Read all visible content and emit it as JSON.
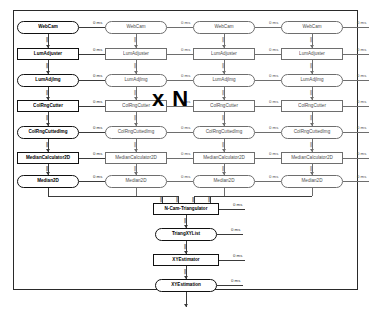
{
  "diagram": {
    "multiplier_label": "x N",
    "timing_label": "0 ms",
    "colors": {
      "primary_stroke": "#111111",
      "secondary_stroke": "#6e6e6e",
      "frame": "#2a2a2a",
      "text": "#2b2b2b",
      "background": "#ffffff"
    },
    "camera_branches": [
      {
        "index": 1,
        "emphasis": "primary",
        "nodes": [
          {
            "label": "WebCam",
            "shape": "data",
            "timing": "0 ms"
          },
          {
            "label": "LumAdjuster",
            "shape": "proc",
            "timing": "0 ms"
          },
          {
            "label": "LumAdjImg",
            "shape": "data",
            "timing": "0 ms"
          },
          {
            "label": "ColRngCutter",
            "shape": "proc",
            "timing": "0 ms"
          },
          {
            "label": "ColRngCuttedImg",
            "shape": "data",
            "timing": "0 ms"
          },
          {
            "label": "MedianCalculator2D",
            "shape": "proc",
            "timing": "0 ms"
          },
          {
            "label": "Median2D",
            "shape": "data",
            "timing": "0 ms"
          }
        ]
      },
      {
        "index": 2,
        "emphasis": "dim",
        "nodes": [
          {
            "label": "WebCam",
            "shape": "data",
            "timing": "0 ms"
          },
          {
            "label": "LumAdjuster",
            "shape": "proc",
            "timing": "0 ms"
          },
          {
            "label": "LumAdjImg",
            "shape": "data",
            "timing": "0 ms"
          },
          {
            "label": "ColRngCutter",
            "shape": "proc",
            "timing": "0 ms"
          },
          {
            "label": "ColRngCuttedImg",
            "shape": "data",
            "timing": "0 ms"
          },
          {
            "label": "MedianCalculator2D",
            "shape": "proc",
            "timing": "0 ms"
          },
          {
            "label": "Median2D",
            "shape": "data",
            "timing": "0 ms"
          }
        ]
      },
      {
        "index": 3,
        "emphasis": "dim",
        "nodes": [
          {
            "label": "WebCam",
            "shape": "data",
            "timing": "0 ms"
          },
          {
            "label": "LumAdjuster",
            "shape": "proc",
            "timing": "0 ms"
          },
          {
            "label": "LumAdjImg",
            "shape": "data",
            "timing": "0 ms"
          },
          {
            "label": "ColRngCutter",
            "shape": "proc",
            "timing": "0 ms"
          },
          {
            "label": "ColRngCuttedImg",
            "shape": "data",
            "timing": "0 ms"
          },
          {
            "label": "MedianCalculator2D",
            "shape": "proc",
            "timing": "0 ms"
          },
          {
            "label": "Median2D",
            "shape": "data",
            "timing": "0 ms"
          }
        ]
      },
      {
        "index": 4,
        "emphasis": "dim",
        "nodes": [
          {
            "label": "WebCam",
            "shape": "data",
            "timing": "0 ms"
          },
          {
            "label": "LumAdjuster",
            "shape": "proc",
            "timing": "0 ms"
          },
          {
            "label": "LumAdjImg",
            "shape": "data",
            "timing": "0 ms"
          },
          {
            "label": "ColRngCutter",
            "shape": "proc",
            "timing": "0 ms"
          },
          {
            "label": "ColRngCuttedImg",
            "shape": "data",
            "timing": "0 ms"
          },
          {
            "label": "MedianCalculator2D",
            "shape": "proc",
            "timing": "0 ms"
          },
          {
            "label": "Median2D",
            "shape": "data",
            "timing": "0 ms"
          }
        ]
      }
    ],
    "fusion_chain": [
      {
        "label": "N-Cam-Triangulator",
        "shape": "proc",
        "timing": "0 ms"
      },
      {
        "label": "TriangXYList",
        "shape": "data",
        "timing": "0 ms"
      },
      {
        "label": "XYEstimator",
        "shape": "proc",
        "timing": "0 ms"
      },
      {
        "label": "XYEstimation",
        "shape": "data",
        "timing": "0 ms"
      }
    ]
  }
}
